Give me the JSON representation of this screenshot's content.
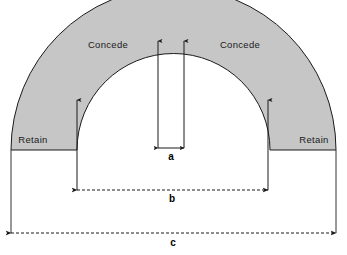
{
  "figure": {
    "background_color": "#ffffff",
    "band_fill_color": "#c6c6c6",
    "band_stroke_color": "#1a1a1a",
    "annotation_color": "#000000"
  },
  "regions": [
    {
      "id": "concede-left",
      "label": "Concede",
      "x": 108,
      "y": 48
    },
    {
      "id": "concede-right",
      "label": "Concede",
      "x": 240,
      "y": 48
    },
    {
      "id": "retain-left",
      "label": "Retain",
      "x": 33,
      "y": 143
    },
    {
      "id": "retain-right",
      "label": "Retain",
      "x": 314,
      "y": 143
    }
  ],
  "dimensions": [
    {
      "id": "dim-a",
      "label": "a",
      "label_x": 171,
      "label_y": 160,
      "style": "double-arrow-solid",
      "x1": 158,
      "x2": 184,
      "y": 148,
      "description": "inner gap width between the two central leader lines"
    },
    {
      "id": "dim-b",
      "label": "b",
      "label_x": 172,
      "label_y": 202,
      "style": "double-arrow-dashed",
      "x1": 77,
      "x2": 268,
      "y": 190,
      "description": "inner span of the arch opening"
    },
    {
      "id": "dim-c",
      "label": "c",
      "label_x": 173,
      "label_y": 246,
      "style": "double-arrow-dashed",
      "x1": 11,
      "x2": 336,
      "y": 233,
      "description": "overall outer span of the arch"
    }
  ],
  "leaders": [
    {
      "id": "leader-center-left",
      "x": 158,
      "y_tail": 148,
      "y_tip": 39
    },
    {
      "id": "leader-center-right",
      "x": 184,
      "y_tail": 148,
      "y_tip": 39
    },
    {
      "id": "leader-flank-left",
      "x": 77,
      "y_tail": 190,
      "y_tip": 98
    },
    {
      "id": "leader-flank-right",
      "x": 268,
      "y_tail": 190,
      "y_tip": 98
    }
  ],
  "geometry": {
    "center_x": 173.5,
    "baseline_y": 150,
    "outer_radius": 162.5,
    "inner_radius": 96.5
  }
}
